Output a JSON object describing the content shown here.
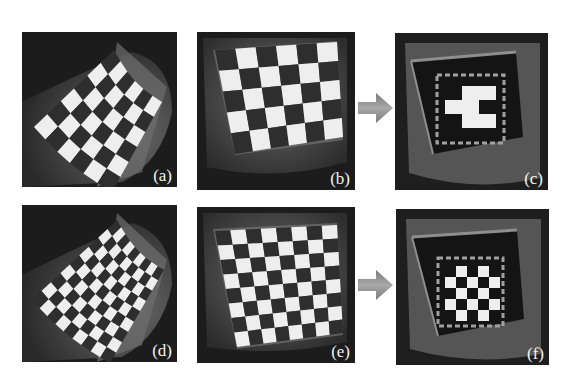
{
  "figure": {
    "panels": [
      {
        "id": "a",
        "label": "(a)",
        "description": "curved warped checkerboard, 6x6 squares"
      },
      {
        "id": "b",
        "label": "(b)",
        "description": "rectified planar checkerboard, 6 columns x 5 rows"
      },
      {
        "id": "c",
        "label": "(c)",
        "description": "dark target region with dashed selection box, sparse white squares (3x4)"
      },
      {
        "id": "d",
        "label": "(d)",
        "description": "curved warped checkerboard, 9x9 squares"
      },
      {
        "id": "e",
        "label": "(e)",
        "description": "rectified planar checkerboard, 8x8"
      },
      {
        "id": "f",
        "label": "(f)",
        "description": "dark target region with dashed selection box, white squares (5x5 checker)"
      }
    ],
    "arrows": [
      {
        "from": "b",
        "to": "c",
        "color": "#8a8a8a"
      },
      {
        "from": "e",
        "to": "f",
        "color": "#8a8a8a"
      }
    ],
    "colors": {
      "panel_bg": "#1e1e1e",
      "surface": "#5a5a5a",
      "dark_square": "#2e2e2e",
      "light_square": "#eeeeee",
      "dashed_box": "#9a9a9a",
      "arrow": "#8a8a8a"
    },
    "patterns": {
      "c_white_cells": [
        [
          0,
          1
        ],
        [
          0,
          2
        ],
        [
          1,
          0
        ],
        [
          1,
          1
        ],
        [
          2,
          1
        ],
        [
          2,
          2
        ]
      ],
      "f_white_cells": [
        [
          0,
          1
        ],
        [
          0,
          3
        ],
        [
          1,
          0
        ],
        [
          1,
          2
        ],
        [
          1,
          4
        ],
        [
          2,
          1
        ],
        [
          2,
          3
        ],
        [
          3,
          0
        ],
        [
          3,
          2
        ],
        [
          3,
          4
        ],
        [
          4,
          1
        ],
        [
          4,
          3
        ]
      ]
    }
  }
}
